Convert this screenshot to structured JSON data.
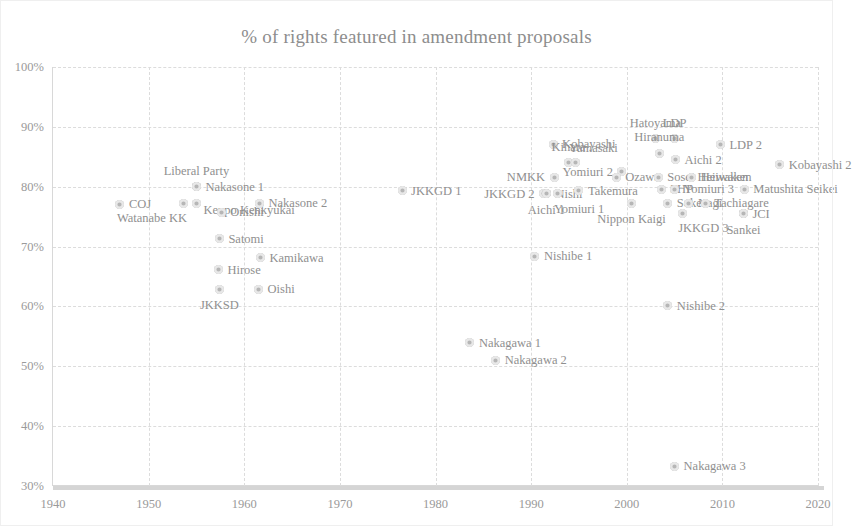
{
  "chart_data": {
    "type": "scatter",
    "title": "% of rights featured in amendment proposals",
    "xlabel": "",
    "ylabel": "",
    "xlim": [
      1940,
      2020
    ],
    "ylim": [
      0.3,
      1.0
    ],
    "xticks": [
      "1940",
      "1950",
      "1960",
      "1970",
      "1980",
      "1990",
      "2000",
      "2010",
      "2020"
    ],
    "xtick_values": [
      1940,
      1950,
      1960,
      1970,
      1980,
      1990,
      2000,
      2010,
      2020
    ],
    "yticks": [
      "30%",
      "40%",
      "50%",
      "60%",
      "70%",
      "80%",
      "90%",
      "100%"
    ],
    "ytick_values": [
      0.3,
      0.4,
      0.5,
      0.6,
      0.7,
      0.8,
      0.9,
      1.0
    ],
    "grid": true,
    "legend": "none",
    "marker_color": "#b6b6b6",
    "text_color": "#8f8f8f",
    "points": [
      {
        "label": "COJ",
        "x": 1947.0,
        "y": 0.771,
        "label_pos": "right"
      },
      {
        "label": "Liberal Party",
        "x": 1955.0,
        "y": 0.8,
        "label_pos": "above"
      },
      {
        "label": "Nakasone 1",
        "x": 1955.0,
        "y": 0.8,
        "label_pos": "right"
      },
      {
        "label": "Watanabe KK",
        "x": 1953.6,
        "y": 0.772,
        "label_pos": "below-left"
      },
      {
        "label": "Kenpo Kenkyukai",
        "x": 1955.0,
        "y": 0.772,
        "label_pos": "right-low"
      },
      {
        "label": "Nakasone 2",
        "x": 1961.6,
        "y": 0.772,
        "label_pos": "right"
      },
      {
        "label": "Onishi",
        "x": 1957.6,
        "y": 0.757,
        "label_pos": "right"
      },
      {
        "label": "Satomi",
        "x": 1957.4,
        "y": 0.713,
        "label_pos": "right"
      },
      {
        "label": "Kamikawa",
        "x": 1961.7,
        "y": 0.681,
        "label_pos": "right"
      },
      {
        "label": "Hirose",
        "x": 1957.3,
        "y": 0.661,
        "label_pos": "right"
      },
      {
        "label": "JKKSD",
        "x": 1957.4,
        "y": 0.629,
        "label_pos": "below"
      },
      {
        "label": "Oishi",
        "x": 1961.5,
        "y": 0.629,
        "label_pos": "right"
      },
      {
        "label": "JKKGD 1",
        "x": 1976.5,
        "y": 0.793,
        "label_pos": "right"
      },
      {
        "label": "JKKGD 2",
        "x": 1991.3,
        "y": 0.788,
        "label_pos": "left"
      },
      {
        "label": "Nishi",
        "x": 1991.6,
        "y": 0.788,
        "label_pos": "right"
      },
      {
        "label": "Aichi 1",
        "x": 1991.6,
        "y": 0.788,
        "label_pos": "below"
      },
      {
        "label": "Yomiuri 1",
        "x": 1992.8,
        "y": 0.788,
        "label_pos": "below-right"
      },
      {
        "label": "Kobayashi",
        "x": 1992.3,
        "y": 0.871,
        "label_pos": "right"
      },
      {
        "label": "NMKK",
        "x": 1992.4,
        "y": 0.816,
        "label_pos": "left"
      },
      {
        "label": "Kihara",
        "x": 1993.9,
        "y": 0.84,
        "label_pos": "above"
      },
      {
        "label": "Yamasaki",
        "x": 1994.6,
        "y": 0.84,
        "label_pos": "above-right"
      },
      {
        "label": "Takemura",
        "x": 1995.0,
        "y": 0.793,
        "label_pos": "right"
      },
      {
        "label": "Yomiuri 2",
        "x": 1999.5,
        "y": 0.825,
        "label_pos": "left"
      },
      {
        "label": "Ozawa",
        "x": 1998.9,
        "y": 0.816,
        "label_pos": "right"
      },
      {
        "label": "Hatoyama",
        "x": 2003.0,
        "y": 0.88,
        "label_pos": "above"
      },
      {
        "label": "LDP",
        "x": 2005.0,
        "y": 0.88,
        "label_pos": "above"
      },
      {
        "label": "Hiranuma",
        "x": 2003.4,
        "y": 0.856,
        "label_pos": "above"
      },
      {
        "label": "Aichi 2",
        "x": 2005.1,
        "y": 0.845,
        "label_pos": "right"
      },
      {
        "label": "Sosei Heiwaken",
        "x": 2003.3,
        "y": 0.816,
        "label_pos": "right"
      },
      {
        "label": "Heiwaken",
        "x": 2006.8,
        "y": 0.816,
        "label_pos": "right"
      },
      {
        "label": "PHP",
        "x": 2003.6,
        "y": 0.796,
        "label_pos": "right"
      },
      {
        "label": "Yomiuri 3",
        "x": 2005.0,
        "y": 0.796,
        "label_pos": "right"
      },
      {
        "label": "Nippon Kaigi",
        "x": 2000.5,
        "y": 0.772,
        "label_pos": "below"
      },
      {
        "label": "Soken",
        "x": 2004.3,
        "y": 0.772,
        "label_pos": "right"
      },
      {
        "label": "Nagi",
        "x": 2006.5,
        "y": 0.772,
        "label_pos": "right"
      },
      {
        "label": "Tachiagare",
        "x": 2008.2,
        "y": 0.772,
        "label_pos": "right"
      },
      {
        "label": "JKKGD 3",
        "x": 2005.8,
        "y": 0.756,
        "label_pos": "below-right"
      },
      {
        "label": "LDP 2",
        "x": 2009.8,
        "y": 0.87,
        "label_pos": "right"
      },
      {
        "label": "Kobayashi 2",
        "x": 2016.0,
        "y": 0.837,
        "label_pos": "right"
      },
      {
        "label": "Matushita Seikei",
        "x": 2012.3,
        "y": 0.796,
        "label_pos": "right"
      },
      {
        "label": "JCI",
        "x": 2012.2,
        "y": 0.755,
        "label_pos": "right"
      },
      {
        "label": "Sankei",
        "x": 2012.2,
        "y": 0.755,
        "label_pos": "below"
      },
      {
        "label": "Nishibe 1",
        "x": 1990.4,
        "y": 0.684,
        "label_pos": "right"
      },
      {
        "label": "Nishibe 2",
        "x": 2004.3,
        "y": 0.601,
        "label_pos": "right"
      },
      {
        "label": "Nakagawa 1",
        "x": 1983.6,
        "y": 0.539,
        "label_pos": "right"
      },
      {
        "label": "Nakagawa 2",
        "x": 1986.3,
        "y": 0.51,
        "label_pos": "right"
      },
      {
        "label": "Nakagawa 3",
        "x": 2005.0,
        "y": 0.333,
        "label_pos": "right"
      }
    ]
  }
}
